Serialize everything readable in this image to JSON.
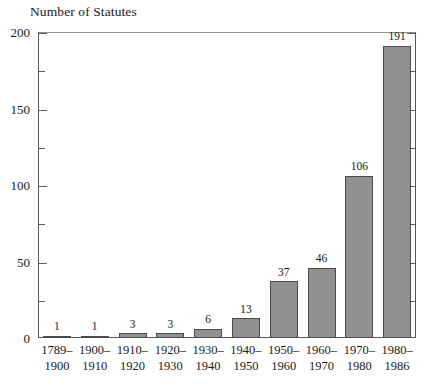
{
  "chart_data": {
    "type": "bar",
    "title": "Number of Statutes",
    "xlabel": "",
    "ylabel": "Number of Statutes",
    "ylim": [
      0,
      200
    ],
    "ytick_major": [
      0,
      50,
      100,
      150,
      200
    ],
    "ytick_minor": [
      25,
      75,
      125,
      175
    ],
    "grid": false,
    "legend": null,
    "categories": [
      "1789–1900",
      "1900–1910",
      "1910–1920",
      "1920–1930",
      "1930–1940",
      "1940–1950",
      "1950–1960",
      "1960–1970",
      "1970–1980",
      "1980–1986"
    ],
    "category_lines": [
      [
        "1789–",
        "1900"
      ],
      [
        "1900–",
        "1910"
      ],
      [
        "1910–",
        "1920"
      ],
      [
        "1920–",
        "1930"
      ],
      [
        "1930–",
        "1940"
      ],
      [
        "1940–",
        "1950"
      ],
      [
        "1950–",
        "1960"
      ],
      [
        "1960–",
        "1970"
      ],
      [
        "1970–",
        "1980"
      ],
      [
        "1980–",
        "1986"
      ]
    ],
    "values": [
      1,
      1,
      3,
      3,
      6,
      13,
      37,
      46,
      106,
      191
    ],
    "value_labels": [
      "1",
      "1",
      "3",
      "3",
      "6",
      "13",
      "37",
      "46",
      "106",
      "191"
    ],
    "bar_color": "#909093",
    "bar_edge_color": "#4a4b4e",
    "axis_color": "#55565a",
    "background_color": "#ffffff",
    "text_color": "#1a1a1a"
  }
}
